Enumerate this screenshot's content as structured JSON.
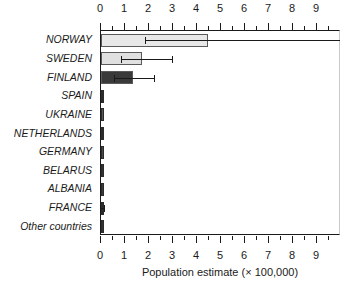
{
  "chart_data": {
    "type": "bar",
    "orientation": "horizontal",
    "title": "",
    "xlabel": "Population estimate (× 100,000)",
    "ylabel": "",
    "xlim": [
      0,
      10
    ],
    "ylim": null,
    "grid": false,
    "legend": null,
    "axis_positions": [
      "top",
      "bottom"
    ],
    "tick_labels_x": [
      "0",
      "1",
      "2",
      "3",
      "4",
      "5",
      "6",
      "7",
      "8",
      "9"
    ],
    "tick_values_x": [
      0,
      1,
      2,
      3,
      4,
      5,
      6,
      7,
      8,
      9
    ],
    "minor_ticks_x": [
      0.5,
      1.5,
      2.5,
      3.5,
      4.5,
      5.5,
      6.5,
      7.5,
      8.5,
      9.5
    ],
    "categories": [
      "NORWAY",
      "SWEDEN",
      "FINLAND",
      "SPAIN",
      "UKRAINE",
      "NETHERLANDS",
      "GERMANY",
      "BELARUS",
      "ALBANIA",
      "FRANCE",
      "Other countries"
    ],
    "values": [
      4.45,
      1.7,
      1.35,
      0.08,
      0.06,
      0.06,
      0.05,
      0.05,
      0.05,
      0.04,
      0.05
    ],
    "error_upper": [
      10.05,
      2.95,
      2.2,
      0.0,
      0.0,
      0.0,
      0.0,
      0.0,
      0.0,
      0.12,
      0.0
    ],
    "error_lower": [
      1.85,
      0.85,
      0.55,
      0.0,
      0.0,
      0.0,
      0.0,
      0.0,
      0.0,
      0.0,
      0.0
    ],
    "bar_colors": [
      "#e8e8e8",
      "#e0e0e0",
      "#3a3a3a",
      "#2b2b2b",
      "#585858",
      "#2b2b2b",
      "#4a4a4a",
      "#333333",
      "#3d3d3d",
      "#2b2b2b",
      "#333333"
    ],
    "bar_edge_color": "#5a5a5a",
    "error_bar_color": "#1a1a1a",
    "axis_color": "#1a1a1a",
    "background_color": "#ffffff"
  }
}
